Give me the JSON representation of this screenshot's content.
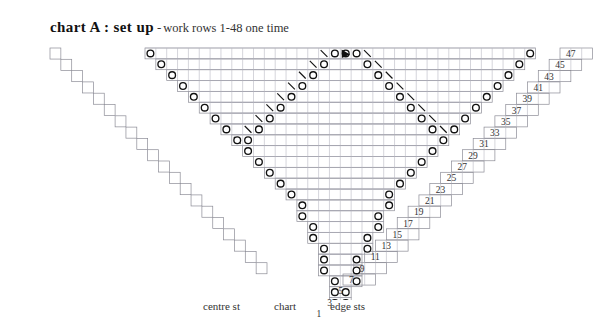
{
  "title": {
    "main": "chart A : set up",
    "dash": "-",
    "sub": "work rows 1-48 one time"
  },
  "captions": [
    {
      "label": "centre st",
      "x": 203,
      "y": 300
    },
    {
      "label": "chart",
      "x": 274,
      "y": 300
    },
    {
      "label": "edge sts",
      "x": 330,
      "y": 300
    }
  ],
  "colors": {
    "grid": "#8c8c96",
    "grid_light": "#b9b9c2",
    "symbol": "#111111",
    "centre_marker": "#111111",
    "text": "#333333",
    "background": "#ffffff"
  },
  "grid": {
    "cell": 10.85,
    "origin_x": 145.0,
    "origin_y": 48.0,
    "rows": 24,
    "columns": 36,
    "note": "24 charted rows (2 chart rows per knit row pair); row labels are odd numbers 1-47"
  },
  "row_numbers": [
    47,
    45,
    43,
    41,
    39,
    37,
    35,
    33,
    31,
    29,
    27,
    25,
    23,
    21,
    19,
    17,
    15,
    13,
    11,
    9,
    7,
    5,
    3,
    1
  ],
  "symbols": {
    "yarn_over": "o",
    "decrease": "\\",
    "centre_stitch": "filled-triangle"
  },
  "chart_data": {
    "type": "table",
    "title": "chart A : set up",
    "subtitle": "work rows 1-48 one time",
    "xlabel": "",
    "ylabel": "",
    "legend": [
      "centre st",
      "chart",
      "edge sts"
    ],
    "row_labels": [
      47,
      45,
      43,
      41,
      39,
      37,
      35,
      33,
      31,
      29,
      27,
      25,
      23,
      21,
      19,
      17,
      15,
      13,
      11,
      9,
      7,
      5,
      3,
      1
    ],
    "centre_column": 18,
    "shape": "triangular-shawl",
    "rows": [
      {
        "row": 47,
        "index": 0,
        "width": 36
      },
      {
        "row": 45,
        "index": 1,
        "width": 34
      },
      {
        "row": 43,
        "index": 2,
        "width": 32
      },
      {
        "row": 41,
        "index": 3,
        "width": 30
      },
      {
        "row": 39,
        "index": 4,
        "width": 28
      },
      {
        "row": 37,
        "index": 5,
        "width": 26
      },
      {
        "row": 35,
        "index": 6,
        "width": 24
      },
      {
        "row": 33,
        "index": 7,
        "width": 22
      },
      {
        "row": 31,
        "index": 8,
        "width": 20
      },
      {
        "row": 29,
        "index": 9,
        "width": 18
      },
      {
        "row": 27,
        "index": 10,
        "width": 16
      },
      {
        "row": 25,
        "index": 11,
        "width": 14
      },
      {
        "row": 23,
        "index": 12,
        "width": 12
      },
      {
        "row": 21,
        "index": 13,
        "width": 10
      },
      {
        "row": 19,
        "index": 14,
        "width": 9
      },
      {
        "row": 17,
        "index": 15,
        "width": 8
      },
      {
        "row": 15,
        "index": 16,
        "width": 7
      },
      {
        "row": 13,
        "index": 17,
        "width": 6
      },
      {
        "row": 11,
        "index": 18,
        "width": 5
      },
      {
        "row": 9,
        "index": 19,
        "width": 4
      },
      {
        "row": 7,
        "index": 20,
        "width": 4
      },
      {
        "row": 5,
        "index": 21,
        "width": 3
      },
      {
        "row": 3,
        "index": 22,
        "width": 2
      },
      {
        "row": 1,
        "index": 23,
        "width": 2
      }
    ]
  }
}
